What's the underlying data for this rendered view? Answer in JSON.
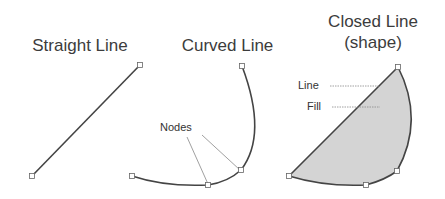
{
  "diagram": {
    "panels": [
      {
        "title": "Straight Line"
      },
      {
        "title": "Curved Line",
        "callout": "Nodes"
      },
      {
        "title_line1": "Closed Line",
        "title_line2": "(shape)",
        "callouts": [
          "Line",
          "Fill"
        ]
      }
    ],
    "colors": {
      "stroke": "#444444",
      "fill": "#d4d4d4",
      "node": "#ffffff",
      "leader": "#888888"
    }
  }
}
